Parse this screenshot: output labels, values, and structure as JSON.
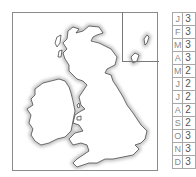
{
  "map": {
    "region": "British Isles",
    "land_fill": "#ffffff",
    "coast_stroke": "#4a4a4a",
    "coast_halo": "#c8c8c8",
    "frame_color": "#8a8a8a",
    "inset": {
      "label": "Shetland / Orkney inset"
    }
  },
  "table": {
    "rows": [
      {
        "month": "J",
        "value": "3"
      },
      {
        "month": "F",
        "value": "3"
      },
      {
        "month": "M",
        "value": "3"
      },
      {
        "month": "A",
        "value": "3"
      },
      {
        "month": "M",
        "value": "2"
      },
      {
        "month": "J",
        "value": "2"
      },
      {
        "month": "J",
        "value": "2"
      },
      {
        "month": "A",
        "value": "2"
      },
      {
        "month": "S",
        "value": "2"
      },
      {
        "month": "O",
        "value": "3"
      },
      {
        "month": "N",
        "value": "3"
      },
      {
        "month": "D",
        "value": "3"
      }
    ]
  }
}
